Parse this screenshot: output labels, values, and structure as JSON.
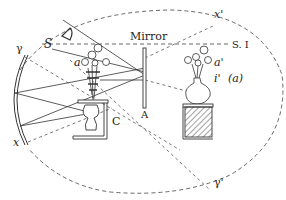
{
  "diagram": {
    "labels": {
      "mirror": "Mirror",
      "s": "S",
      "si": "S. I",
      "gamma": "γ",
      "gamma_prime": "γ'",
      "x": "x",
      "x_prime": "x'",
      "a": "a",
      "a_prime": "a'",
      "i_prime": "i'",
      "i_prime_paren": "(a)",
      "c": "C",
      "A": "A"
    },
    "colors": {
      "stroke": "#333333",
      "dashed": "#555555",
      "hatch": "#444444",
      "background": "#ffffff"
    },
    "elements": {
      "concave_mirror": "curved double-line mirror on left (γ to x)",
      "ellipse": "dashed ellipse passing through γ, x', γ', x",
      "eye": "observer eye at top-left",
      "plane_mirror": "vertical plane mirror labeled A",
      "box_c": "open box C containing inverted vase",
      "real_image": "upright vase with flowers on hatched stand (image)"
    }
  }
}
